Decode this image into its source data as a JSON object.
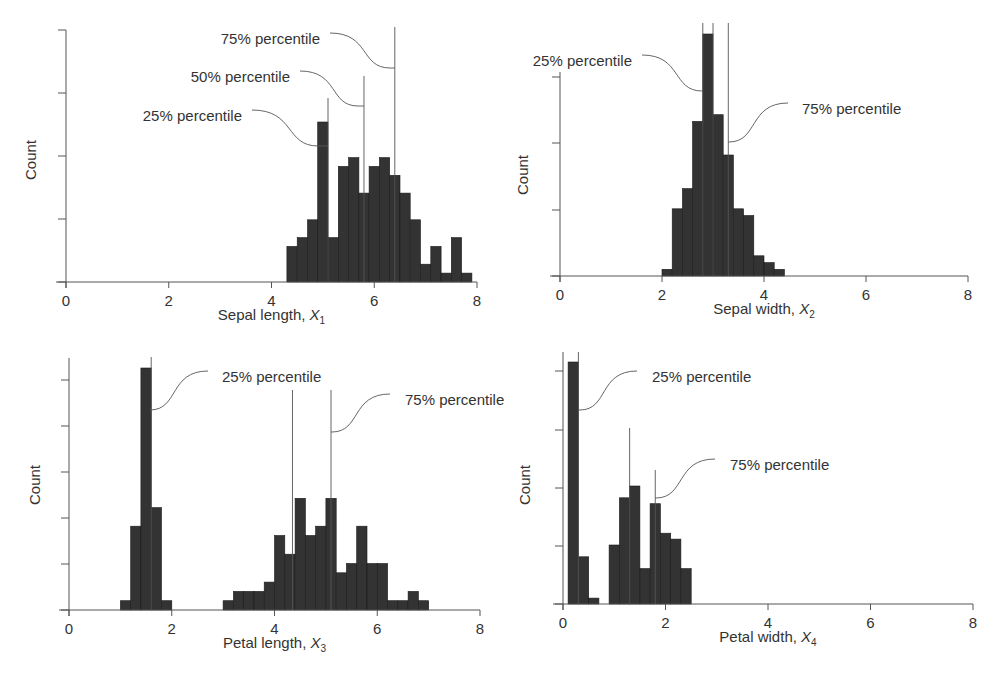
{
  "figure": {
    "bar_color": "#333333",
    "axis_color": "#555555",
    "ylabel": "Count"
  },
  "chart_data": [
    {
      "type": "bar",
      "title": "",
      "xlabel": "Sepal length, X1",
      "xlabel_main": "Sepal length, ",
      "xlabel_var": "X",
      "xlabel_sub": "1",
      "ylabel": "Count",
      "xlim": [
        0,
        8
      ],
      "xticks": [
        "0",
        "2",
        "4",
        "6",
        "8"
      ],
      "ylim": [
        0,
        18
      ],
      "yticks_count": 4,
      "grid": false,
      "bin_start": 4.3,
      "bin_width": 0.2,
      "values": [
        4,
        5,
        7,
        18,
        5,
        13,
        14,
        10,
        13,
        14,
        12,
        10,
        7,
        2,
        4,
        1,
        5,
        1
      ],
      "percentile_lines": [
        {
          "label": "25% percentile",
          "x": 5.1
        },
        {
          "label": "50% percentile",
          "x": 5.8
        },
        {
          "label": "75% percentile",
          "x": 6.4
        }
      ]
    },
    {
      "type": "bar",
      "title": "",
      "xlabel": "Sepal width, X2",
      "xlabel_main": "Sepal width, ",
      "xlabel_var": "X",
      "xlabel_sub": "2",
      "ylabel": "Count",
      "xlim": [
        0,
        8
      ],
      "xticks": [
        "0",
        "2",
        "4",
        "6",
        "8"
      ],
      "ylim": [
        0,
        36
      ],
      "yticks_count": 4,
      "grid": false,
      "bin_start": 2.0,
      "bin_width": 0.2,
      "values": [
        1,
        10,
        13,
        23,
        36,
        24,
        18,
        10,
        9,
        3,
        2,
        1
      ],
      "percentile_lines": [
        {
          "label": "25% percentile",
          "x": 2.8
        },
        {
          "label": "50% percentile",
          "x": 3.0
        },
        {
          "label": "75% percentile",
          "x": 3.3
        }
      ]
    },
    {
      "type": "bar",
      "title": "",
      "xlabel": "Petal length, X3",
      "xlabel_main": "Petal length, ",
      "xlabel_var": "X",
      "xlabel_sub": "3",
      "ylabel": "Count",
      "xlim": [
        0,
        8
      ],
      "xticks": [
        "0",
        "2",
        "4",
        "6",
        "8"
      ],
      "ylim": [
        0,
        26
      ],
      "yticks_count": 5,
      "grid": false,
      "bin_start": 1.0,
      "bin_width": 0.2,
      "values": [
        1,
        9,
        26,
        11,
        1,
        0,
        0,
        0,
        0,
        0,
        1,
        2,
        2,
        2,
        3,
        8,
        6,
        12,
        8,
        9,
        12,
        4,
        5,
        9,
        5,
        5,
        1,
        1,
        2,
        1
      ],
      "percentile_lines": [
        {
          "label": "25% percentile",
          "x": 1.6
        },
        {
          "label": "",
          "x": 4.35
        },
        {
          "label": "75% percentile",
          "x": 5.1
        }
      ]
    },
    {
      "type": "bar",
      "title": "",
      "xlabel": "Petal width, X4",
      "xlabel_main": "Petal width, ",
      "xlabel_var": "X",
      "xlabel_sub": "4",
      "ylabel": "Count",
      "xlim": [
        0,
        8
      ],
      "xticks": [
        "0",
        "2",
        "4",
        "6",
        "8"
      ],
      "ylim": [
        0,
        41
      ],
      "yticks_count": 4,
      "grid": false,
      "bin_start": 0.1,
      "bin_width": 0.2,
      "values": [
        41,
        8,
        1,
        0,
        10,
        18,
        20,
        6,
        17,
        12,
        11,
        6
      ],
      "percentile_lines": [
        {
          "label": "25% percentile",
          "x": 0.3
        },
        {
          "label": "",
          "x": 1.3
        },
        {
          "label": "75% percentile",
          "x": 1.8
        }
      ]
    }
  ]
}
